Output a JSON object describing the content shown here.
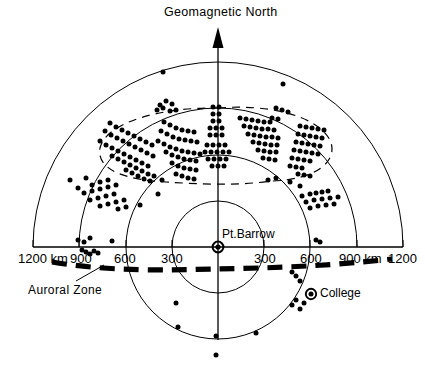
{
  "figure": {
    "title": "Geomagnetic North",
    "center_station": "Pt.Barrow",
    "secondary_station": "College",
    "annotation": "Auroral Zone",
    "north_arrow_icon": "up-arrow-icon",
    "center_marker_icon": "station-marker-icon",
    "college_marker_icon": "station-marker-icon"
  },
  "chart_data": {
    "type": "scatter",
    "title": "Geomagnetic North",
    "subtitle": "",
    "xlabel": "",
    "ylabel": "",
    "projection": "polar-range-rings",
    "grid": true,
    "legend_position": "none",
    "center": {
      "label": "Pt.Barrow",
      "x_px": 218,
      "y_px": 247,
      "range_km": 0
    },
    "range_rings_km": [
      300,
      600,
      900,
      1200
    ],
    "ring_radii_px": [
      46,
      92,
      139,
      185
    ],
    "axis_left_tick_labels": [
      "1200 km",
      "900",
      "600",
      "300"
    ],
    "axis_right_tick_labels": [
      "300",
      "600",
      "900 km",
      "1200"
    ],
    "axis_left_tick_values_km": [
      1200,
      900,
      600,
      300
    ],
    "axis_right_tick_values_km": [
      300,
      600,
      900,
      1200
    ],
    "stations": [
      {
        "name": "Pt.Barrow",
        "x_px": 218,
        "y_px": 247,
        "marker": "ringed-dot"
      },
      {
        "name": "College",
        "x_px": 311,
        "y_px": 294,
        "marker": "ringed-dot"
      }
    ],
    "annotations": [
      {
        "text": "Auroral Zone",
        "x_px": 28,
        "y_px": 283,
        "leader_to_x_px": 103,
        "leader_to_y_px": 264
      },
      {
        "text": "Geomagnetic North",
        "x_px": 164,
        "y_px": 5
      }
    ],
    "overlays": [
      {
        "name": "auroral-zone-band",
        "style": "heavy-dashed",
        "description": "Heavy dashed curve crossing the plot just below the east-west baseline"
      },
      {
        "name": "radar-echo-envelope",
        "style": "thin-dashed-ellipse",
        "description": "Thin dashed oval enclosing the main echo cluster north of Pt.Barrow"
      }
    ],
    "echo_points_px": [
      [
        163,
        72
      ],
      [
        283,
        84
      ],
      [
        160,
        105
      ],
      [
        166,
        101
      ],
      [
        172,
        104
      ],
      [
        157,
        110
      ],
      [
        163,
        108
      ],
      [
        170,
        111
      ],
      [
        176,
        110
      ],
      [
        110,
        123
      ],
      [
        116,
        127
      ],
      [
        122,
        130
      ],
      [
        128,
        133
      ],
      [
        134,
        136
      ],
      [
        140,
        139
      ],
      [
        146,
        142
      ],
      [
        152,
        145
      ],
      [
        105,
        131
      ],
      [
        111,
        135
      ],
      [
        117,
        138
      ],
      [
        123,
        141
      ],
      [
        129,
        144
      ],
      [
        135,
        147
      ],
      [
        141,
        150
      ],
      [
        147,
        153
      ],
      [
        153,
        156
      ],
      [
        100,
        141
      ],
      [
        106,
        145
      ],
      [
        112,
        148
      ],
      [
        118,
        151
      ],
      [
        124,
        154
      ],
      [
        130,
        157
      ],
      [
        136,
        160
      ],
      [
        142,
        163
      ],
      [
        148,
        166
      ],
      [
        112,
        156
      ],
      [
        118,
        159
      ],
      [
        124,
        162
      ],
      [
        130,
        165
      ],
      [
        136,
        168
      ],
      [
        142,
        171
      ],
      [
        148,
        174
      ],
      [
        154,
        176
      ],
      [
        126,
        170
      ],
      [
        132,
        173
      ],
      [
        138,
        176
      ],
      [
        144,
        179
      ],
      [
        150,
        181
      ],
      [
        164,
        122
      ],
      [
        170,
        125
      ],
      [
        176,
        128
      ],
      [
        182,
        130
      ],
      [
        188,
        131
      ],
      [
        194,
        132
      ],
      [
        161,
        131
      ],
      [
        167,
        134
      ],
      [
        173,
        137
      ],
      [
        179,
        139
      ],
      [
        185,
        140
      ],
      [
        191,
        141
      ],
      [
        197,
        142
      ],
      [
        158,
        141
      ],
      [
        164,
        144
      ],
      [
        170,
        147
      ],
      [
        176,
        149
      ],
      [
        182,
        151
      ],
      [
        188,
        152
      ],
      [
        194,
        153
      ],
      [
        200,
        154
      ],
      [
        166,
        152
      ],
      [
        172,
        155
      ],
      [
        178,
        157
      ],
      [
        184,
        159
      ],
      [
        190,
        160
      ],
      [
        196,
        161
      ],
      [
        172,
        163
      ],
      [
        178,
        166
      ],
      [
        184,
        168
      ],
      [
        190,
        169
      ],
      [
        196,
        170
      ],
      [
        176,
        174
      ],
      [
        182,
        176
      ],
      [
        188,
        178
      ],
      [
        194,
        179
      ],
      [
        213,
        107
      ],
      [
        219,
        107
      ],
      [
        213,
        114
      ],
      [
        219,
        114
      ],
      [
        213,
        121
      ],
      [
        219,
        121
      ],
      [
        210,
        128
      ],
      [
        216,
        128
      ],
      [
        222,
        128
      ],
      [
        210,
        135
      ],
      [
        216,
        135
      ],
      [
        222,
        135
      ],
      [
        207,
        145
      ],
      [
        213,
        145
      ],
      [
        219,
        145
      ],
      [
        225,
        145
      ],
      [
        205,
        152
      ],
      [
        211,
        152
      ],
      [
        217,
        152
      ],
      [
        223,
        152
      ],
      [
        229,
        152
      ],
      [
        208,
        159
      ],
      [
        214,
        159
      ],
      [
        220,
        159
      ],
      [
        226,
        159
      ],
      [
        212,
        166
      ],
      [
        218,
        166
      ],
      [
        224,
        166
      ],
      [
        240,
        118
      ],
      [
        246,
        119
      ],
      [
        252,
        120
      ],
      [
        258,
        121
      ],
      [
        264,
        122
      ],
      [
        270,
        122
      ],
      [
        244,
        126
      ],
      [
        250,
        127
      ],
      [
        256,
        128
      ],
      [
        262,
        129
      ],
      [
        268,
        129
      ],
      [
        274,
        130
      ],
      [
        248,
        134
      ],
      [
        254,
        135
      ],
      [
        260,
        136
      ],
      [
        266,
        137
      ],
      [
        272,
        137
      ],
      [
        278,
        138
      ],
      [
        253,
        142
      ],
      [
        259,
        143
      ],
      [
        265,
        144
      ],
      [
        271,
        145
      ],
      [
        277,
        145
      ],
      [
        258,
        150
      ],
      [
        264,
        151
      ],
      [
        270,
        152
      ],
      [
        276,
        152
      ],
      [
        263,
        158
      ],
      [
        269,
        159
      ],
      [
        275,
        160
      ],
      [
        276,
        108
      ],
      [
        282,
        110
      ],
      [
        288,
        112
      ],
      [
        272,
        118
      ],
      [
        278,
        119
      ],
      [
        300,
        126
      ],
      [
        306,
        127
      ],
      [
        312,
        128
      ],
      [
        318,
        129
      ],
      [
        324,
        130
      ],
      [
        298,
        134
      ],
      [
        304,
        135
      ],
      [
        310,
        136
      ],
      [
        316,
        137
      ],
      [
        322,
        138
      ],
      [
        296,
        142
      ],
      [
        302,
        143
      ],
      [
        308,
        144
      ],
      [
        314,
        145
      ],
      [
        320,
        146
      ],
      [
        294,
        150
      ],
      [
        300,
        151
      ],
      [
        306,
        152
      ],
      [
        312,
        153
      ],
      [
        318,
        154
      ],
      [
        292,
        158
      ],
      [
        298,
        159
      ],
      [
        304,
        160
      ],
      [
        310,
        161
      ],
      [
        290,
        166
      ],
      [
        296,
        167
      ],
      [
        302,
        168
      ],
      [
        298,
        174
      ],
      [
        304,
        175
      ],
      [
        310,
        176
      ],
      [
        70,
        180
      ],
      [
        86,
        178
      ],
      [
        78,
        188
      ],
      [
        92,
        185
      ],
      [
        100,
        182
      ],
      [
        108,
        180
      ],
      [
        84,
        193
      ],
      [
        92,
        191
      ],
      [
        100,
        189
      ],
      [
        108,
        187
      ],
      [
        116,
        185
      ],
      [
        90,
        200
      ],
      [
        98,
        198
      ],
      [
        106,
        196
      ],
      [
        114,
        194
      ],
      [
        100,
        206
      ],
      [
        108,
        204
      ],
      [
        116,
        202
      ],
      [
        124,
        200
      ],
      [
        118,
        209
      ],
      [
        126,
        207
      ],
      [
        140,
        205
      ],
      [
        158,
        194
      ],
      [
        162,
        180
      ],
      [
        268,
        180
      ],
      [
        276,
        178
      ],
      [
        290,
        182
      ],
      [
        300,
        186
      ],
      [
        302,
        196
      ],
      [
        310,
        194
      ],
      [
        316,
        193
      ],
      [
        322,
        192
      ],
      [
        328,
        191
      ],
      [
        306,
        202
      ],
      [
        314,
        200
      ],
      [
        322,
        199
      ],
      [
        330,
        198
      ],
      [
        338,
        197
      ],
      [
        310,
        208
      ],
      [
        318,
        206
      ],
      [
        326,
        205
      ],
      [
        334,
        204
      ],
      [
        78,
        240
      ],
      [
        84,
        242
      ],
      [
        90,
        238
      ],
      [
        112,
        241
      ],
      [
        82,
        250
      ],
      [
        86,
        252
      ],
      [
        90,
        254
      ],
      [
        94,
        251
      ],
      [
        98,
        253
      ],
      [
        316,
        240
      ],
      [
        320,
        242
      ],
      [
        292,
        272
      ],
      [
        296,
        276
      ],
      [
        300,
        281
      ],
      [
        296,
        300
      ],
      [
        304,
        303
      ],
      [
        300,
        309
      ],
      [
        292,
        305
      ],
      [
        176,
        303
      ],
      [
        178,
        327
      ],
      [
        216,
        336
      ],
      [
        256,
        333
      ],
      [
        216,
        355
      ]
    ]
  },
  "ticks": {
    "left": [
      {
        "label": "1200 km",
        "x_px": 18,
        "y_px": 251
      },
      {
        "label": "900",
        "x_px": 70,
        "y_px": 251
      },
      {
        "label": "600",
        "x_px": 114,
        "y_px": 251
      },
      {
        "label": "300",
        "x_px": 161,
        "y_px": 251
      }
    ],
    "right": [
      {
        "label": "300",
        "x_px": 254,
        "y_px": 251
      },
      {
        "label": "600",
        "x_px": 300,
        "y_px": 251
      },
      {
        "label": "900 km",
        "x_px": 339,
        "y_px": 251
      },
      {
        "label": "1200",
        "x_px": 388,
        "y_px": 251
      }
    ]
  }
}
